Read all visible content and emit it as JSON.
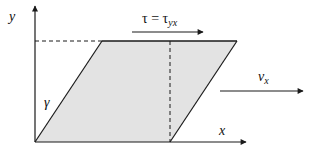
{
  "diagram": {
    "labels": {
      "y_axis": "y",
      "x_axis": "x",
      "shear_angle": "γ",
      "shear_stress": {
        "lhs": "τ",
        "eq": " = ",
        "rhs": "τ",
        "rhs_sub": "yx"
      },
      "velocity": {
        "base": "v",
        "sub": "x"
      }
    },
    "colors": {
      "line": "#1a1a1a",
      "fill": "#e3e3e3",
      "background": "#ffffff"
    }
  }
}
